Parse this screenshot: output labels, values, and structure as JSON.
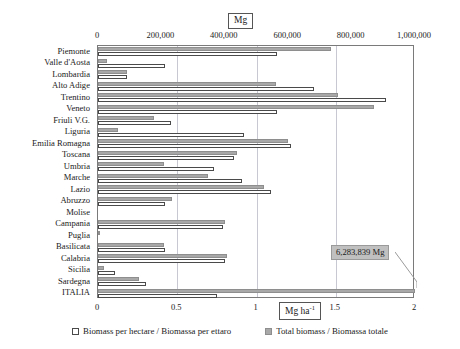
{
  "chart_data": {
    "type": "bar",
    "orientation": "horizontal",
    "title": "",
    "subtitle": "",
    "categories": [
      "Piemonte",
      "Valle d'Aosta",
      "Lombardia",
      "Alto Adige",
      "Trentino",
      "Veneto",
      "Friuli V.G.",
      "Liguria",
      "Emilia Romagna",
      "Toscana",
      "Umbria",
      "Marche",
      "Lazio",
      "Abruzzo",
      "Molise",
      "Campania",
      "Puglia",
      "Basilicata",
      "Calabria",
      "Sicilia",
      "Sardegna",
      "ITALIA"
    ],
    "series": [
      {
        "name": "Total biomass / Biomassa totale",
        "unit": "Mg",
        "axis": "top",
        "color": "#a8a8a8",
        "values": [
          736000,
          27000,
          91000,
          560000,
          756000,
          871000,
          178000,
          63000,
          600000,
          440000,
          209000,
          348000,
          525000,
          232000,
          0,
          400000,
          6000,
          209000,
          407000,
          18000,
          129000,
          6283839
        ]
      },
      {
        "name": "Biomass per hectare / Biomassa per ettaro",
        "unit": "Mg ha-1",
        "axis": "bottom",
        "color": "#ffffff",
        "values": [
          1.13,
          0.42,
          0.18,
          1.36,
          1.82,
          1.13,
          0.46,
          0.92,
          1.22,
          0.86,
          0.73,
          0.91,
          1.09,
          0.42,
          0.0,
          0.79,
          0.0,
          0.42,
          0.8,
          0.11,
          0.3,
          0.75
        ]
      }
    ],
    "top_axis": {
      "label": "Mg",
      "ticks": [
        "0",
        "200,000",
        "400,000",
        "600,000",
        "800,000",
        "1,000,000"
      ],
      "tick_values": [
        0,
        200000,
        400000,
        600000,
        800000,
        1000000
      ],
      "min": 0,
      "max": 1000000
    },
    "bottom_axis": {
      "label": "Mg ha-1",
      "ticks": [
        "0",
        "0.5",
        "1",
        "1.5",
        "2"
      ],
      "tick_values": [
        0,
        0.5,
        1,
        1.5,
        2
      ],
      "min": 0,
      "max": 2
    },
    "annotations": [
      {
        "text": "6,283,839 Mg",
        "target_category": "ITALIA",
        "series": "Total biomass / Biomassa totale"
      }
    ],
    "legend": {
      "position": "bottom",
      "entries": [
        {
          "label": "Biomass per hectare / Biomassa per ettaro",
          "swatch": "open"
        },
        {
          "label": "Total biomass / Biomassa totale",
          "swatch": "filled"
        }
      ]
    },
    "grid": {
      "vertical": true,
      "horizontal": false
    }
  },
  "units": {
    "top_label": "Mg",
    "bottom_label_main": "Mg ha",
    "bottom_label_sup": "-1"
  }
}
